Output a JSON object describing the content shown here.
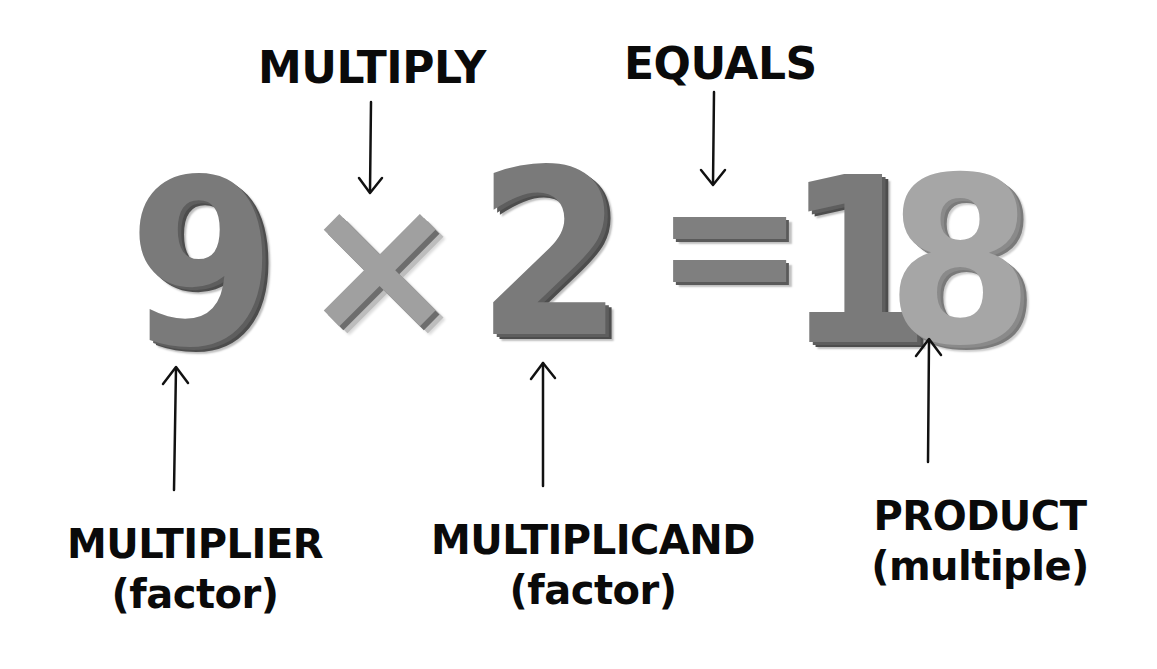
{
  "equation": {
    "multiplier": "9",
    "operator": "×",
    "multiplicand": "2",
    "equals": "=",
    "product": "18",
    "product_digit_1": "1",
    "product_digit_2": "8"
  },
  "labels": {
    "multiply": "MULTIPLY",
    "equals": "EQUALS",
    "multiplier": {
      "term": "MULTIPLIER",
      "sub": "(factor)"
    },
    "multiplicand": {
      "term": "MULTIPLICAND",
      "sub": "(factor)"
    },
    "product": {
      "term": "PRODUCT",
      "sub": "(multiple)"
    }
  },
  "colors": {
    "text": "#0a0a0a",
    "digit_dark": "#7a7a7a",
    "digit_light": "#a6a6a6",
    "background": "#ffffff"
  },
  "arrows": [
    {
      "name": "multiply-arrow",
      "direction": "down",
      "from_label": "MULTIPLY",
      "to": "×"
    },
    {
      "name": "equals-arrow",
      "direction": "down",
      "from_label": "EQUALS",
      "to": "="
    },
    {
      "name": "multiplier-arrow",
      "direction": "up",
      "from_label": "MULTIPLIER",
      "to": "9"
    },
    {
      "name": "multiplicand-arrow",
      "direction": "up",
      "from_label": "MULTIPLICAND",
      "to": "2"
    },
    {
      "name": "product-arrow",
      "direction": "up",
      "from_label": "PRODUCT",
      "to": "18"
    }
  ]
}
